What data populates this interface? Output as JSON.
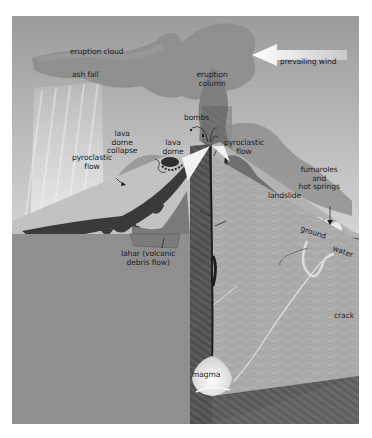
{
  "figure": {
    "labels": {
      "eruption_cloud": "eruption cloud",
      "ash_fall": "ash fall",
      "eruption_column": "eruption\ncolumn",
      "prevailing_wind": "prevailing wind",
      "bombs": "bombs",
      "lava_dome_collapse": "lava\ndome\ncollapse",
      "lava_dome": "lava\ndome",
      "pyroclastic_flow_left": "pyroclastic\nflow",
      "pyroclastic_flow_right": "pyroclastic\nflow",
      "fumaroles": "fumaroles\nand\nhot springs",
      "landslide": "landslide",
      "ground": "ground",
      "water": "water",
      "lahar": "lahar (volcanic\ndebris flow)",
      "crack": "crack",
      "magma": "magma"
    },
    "colors": {
      "sky_top": "#9a9a9a",
      "sky_bottom": "#e6e6e6",
      "cloud": "#8c8c8c",
      "ground_front": "#8e8e8e",
      "ground_side": "#6a6a6a",
      "cut_face_right": "#a8a8a8",
      "slope": "#c4c4c4",
      "lava_flow": "#3c3c3c",
      "magma": "#e8e8e8"
    }
  }
}
